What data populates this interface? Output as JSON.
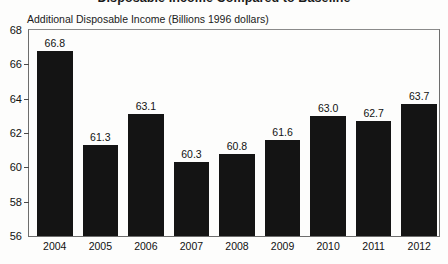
{
  "chart_data": {
    "type": "bar",
    "title": "Disposable Income Compared to Baseline",
    "subtitle": "Additional Disposable Income (Billions 1996 dollars)",
    "xlabel": "",
    "ylabel": "",
    "ylim": [
      56,
      68
    ],
    "yticks": [
      56,
      58,
      60,
      62,
      64,
      66,
      68
    ],
    "grid": false,
    "legend": null,
    "bar_color": "#141414",
    "categories": [
      "2004",
      "2005",
      "2006",
      "2007",
      "2008",
      "2009",
      "2010",
      "2011",
      "2012"
    ],
    "values": [
      66.8,
      61.3,
      63.1,
      60.3,
      60.8,
      61.6,
      63.0,
      62.7,
      63.7
    ],
    "value_labels": [
      "66.8",
      "61.3",
      "63.1",
      "60.3",
      "60.8",
      "61.6",
      "63.0",
      "62.7",
      "63.7"
    ]
  }
}
